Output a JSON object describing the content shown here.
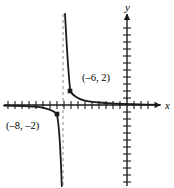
{
  "figure": {
    "kind": "cartesian-graph",
    "width": 174,
    "height": 188,
    "background": "#ffffff",
    "ink": "#1a1a1a"
  },
  "axes": {
    "x_label": "x",
    "y_label": "y",
    "origin_px": [
      127,
      105
    ],
    "unit_px": 7,
    "x_range_px": [
      4,
      160
    ],
    "y_range_px": [
      14,
      186
    ],
    "x_tick_count": 22,
    "y_tick_count": 24,
    "tick_half_len_px": 4,
    "arrow_x": true,
    "arrow_y": true,
    "grid": false
  },
  "asymptotes": {
    "vertical": {
      "x_px": 63,
      "style": "dashed",
      "color": "#8a8a8a",
      "dash": "3,3",
      "top_px": 14,
      "bottom_px": 186
    },
    "horizontal": {
      "y_px": 105,
      "style": "implicit-on-axis"
    }
  },
  "points": [
    {
      "label": "(–6, 2)",
      "marker": "filled-square",
      "x_px": 70,
      "y_px": 91,
      "label_x_px": 82,
      "label_y_px": 73
    },
    {
      "label": "(–8, –2)",
      "marker": "filled-square",
      "x_px": 57,
      "y_px": 114,
      "label_x_px": 6,
      "label_y_px": 121
    }
  ],
  "chart_data": {
    "type": "line",
    "title": "",
    "xlabel": "x",
    "ylabel": "y",
    "curve_family": "rational-hyperbola",
    "vertical_asymptote_x": -9,
    "horizontal_asymptote_y": 0,
    "labeled_points": [
      {
        "x": -6,
        "y": 2
      },
      {
        "x": -8,
        "y": -2
      }
    ],
    "branches": [
      {
        "name": "right-branch",
        "domain_note": "x > vertical asymptote",
        "path_px": "M 65,14 C 66.2,34 67.4,62 70.2,91.0 C 72.8,95.6 77,98.4 84,100.4 C 95,103.0 112,104.3 160,104.8"
      },
      {
        "name": "left-branch",
        "domain_note": "x < vertical asymptote",
        "path_px": "M 4,105.6 C 16,105.6 30,105.9 40,107.2 C 48,108.6 53,110.6 56.6,113.8 C 59.4,122 60.6,150 61.8,186"
      }
    ],
    "xlim": [
      -17,
      5
    ],
    "ylim": [
      -13,
      13
    ],
    "legend": false
  }
}
